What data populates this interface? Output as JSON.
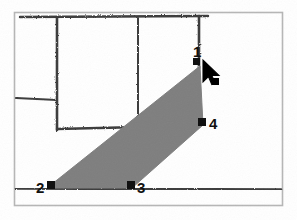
{
  "scene": {
    "title": "Shaded region selection on scanned floor-plan sketch",
    "background_color": "#ffffff",
    "frame_color": "#b6b6b6",
    "ink_color": "#3a3a3a",
    "shade_color": "#7e7e7e",
    "marker_color": "#111111",
    "cursor_color": "#000000"
  },
  "frame": {
    "x": 14,
    "y": 12,
    "width": 269,
    "height": 194
  },
  "sketch_lines": [
    {
      "name": "top-horizontal-rail",
      "x1": 20,
      "y1": 17,
      "x2": 208,
      "y2": 16
    },
    {
      "name": "left-vertical-wall",
      "x1": 57,
      "y1": 18,
      "x2": 57,
      "y2": 130
    },
    {
      "name": "mid-vertical-wall",
      "x1": 138,
      "y1": 18,
      "x2": 138,
      "y2": 128
    },
    {
      "name": "right-vertical-wall",
      "x1": 199,
      "y1": 16,
      "x2": 199,
      "y2": 68
    },
    {
      "name": "left-short-horizontal",
      "x1": 16,
      "y1": 98,
      "x2": 57,
      "y2": 100
    },
    {
      "name": "mid-horizontal-sill",
      "x1": 57,
      "y1": 129,
      "x2": 138,
      "y2": 127
    },
    {
      "name": "right-horizontal-sill",
      "x1": 203,
      "y1": 124,
      "x2": 281,
      "y2": 124
    },
    {
      "name": "bottom-horizontal-baseline",
      "x1": 16,
      "y1": 188,
      "x2": 281,
      "y2": 189
    }
  ],
  "region": {
    "name": "shaded-quad",
    "fill": "#7e7e7e",
    "points": [
      {
        "label": "1",
        "x": 200,
        "y": 66
      },
      {
        "label": "4",
        "x": 203,
        "y": 125
      },
      {
        "label": "3",
        "x": 132,
        "y": 188
      },
      {
        "label": "2",
        "x": 47,
        "y": 188
      }
    ]
  },
  "vertices": [
    {
      "id": "1",
      "label": "1",
      "marker_x": 196,
      "marker_y": 61,
      "label_x": 193,
      "label_y": 44
    },
    {
      "id": "2",
      "label": "2",
      "marker_x": 47,
      "marker_y": 184,
      "label_x": 36,
      "label_y": 180
    },
    {
      "id": "3",
      "label": "3",
      "marker_x": 128,
      "marker_y": 183,
      "label_x": 137,
      "label_y": 180
    },
    {
      "id": "4",
      "label": "4",
      "marker_x": 199,
      "marker_y": 120,
      "label_x": 209,
      "label_y": 116
    }
  ],
  "cursor": {
    "name": "arrow-pointer",
    "x": 203,
    "y": 63,
    "dot_x": 215,
    "dot_y": 81,
    "dot_size": 7
  }
}
